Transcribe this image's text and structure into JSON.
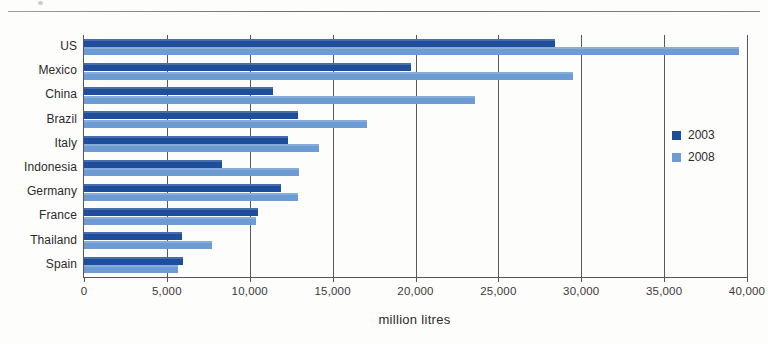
{
  "chart_data": {
    "type": "bar",
    "orientation": "horizontal",
    "title": "",
    "xlabel": "million litres",
    "ylabel": "",
    "xlim": [
      0,
      40000
    ],
    "xticks": [
      0,
      5000,
      10000,
      15000,
      20000,
      25000,
      30000,
      35000,
      40000
    ],
    "xtick_labels": [
      "0",
      "5,000",
      "10,000",
      "15,000",
      "20,000",
      "25,000",
      "30,000",
      "35,000",
      "40,000"
    ],
    "grid": true,
    "grid_axis": "x",
    "legend_position": "right",
    "categories": [
      "US",
      "Mexico",
      "China",
      "Brazil",
      "Italy",
      "Indonesia",
      "Germany",
      "France",
      "Thailand",
      "Spain"
    ],
    "series": [
      {
        "name": "2003",
        "color": "#1f4e9c",
        "values": [
          28400,
          19700,
          11400,
          12900,
          12300,
          8300,
          11900,
          10500,
          5900,
          6000
        ]
      },
      {
        "name": "2008",
        "color": "#6d9bd4",
        "values": [
          39500,
          29500,
          23600,
          17100,
          14200,
          13000,
          12900,
          10400,
          7700,
          5700
        ]
      }
    ]
  },
  "legend": {
    "items": [
      {
        "label": "2003",
        "color": "#1f4e9c"
      },
      {
        "label": "2008",
        "color": "#6d9bd4"
      }
    ]
  }
}
